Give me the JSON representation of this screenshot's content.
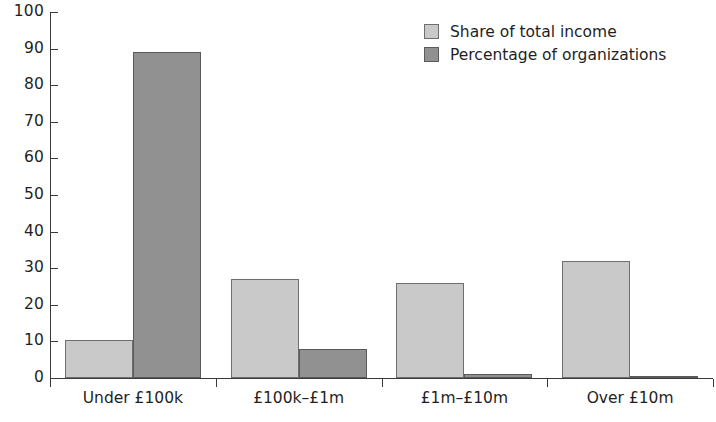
{
  "chart_data": {
    "type": "bar",
    "title": "",
    "xlabel": "",
    "ylabel": "",
    "ylim": [
      0,
      100
    ],
    "ytick_step": 10,
    "yticks": [
      0,
      10,
      20,
      30,
      40,
      50,
      60,
      70,
      80,
      90,
      100
    ],
    "ytick_labels": [
      "0",
      "10",
      "20",
      "30",
      "40",
      "50",
      "60",
      "70",
      "80",
      "90",
      "100"
    ],
    "grid": false,
    "legend_position": "top-right",
    "categories": [
      "Under £100k",
      "£100k–£1m",
      "£1m–£10m",
      "Over £10m"
    ],
    "series": [
      {
        "name": "Share of total income",
        "color": "#c9c9c9",
        "edge_color": "#6e6e6e",
        "values": [
          10.5,
          27,
          26,
          32
        ]
      },
      {
        "name": "Percentage of organizations",
        "color": "#919191",
        "edge_color": "#5a5a5a",
        "values": [
          89,
          8,
          1,
          0.5
        ]
      }
    ]
  },
  "legend": {
    "items": [
      {
        "label": "Share of total income"
      },
      {
        "label": "Percentage of organizations"
      }
    ]
  }
}
